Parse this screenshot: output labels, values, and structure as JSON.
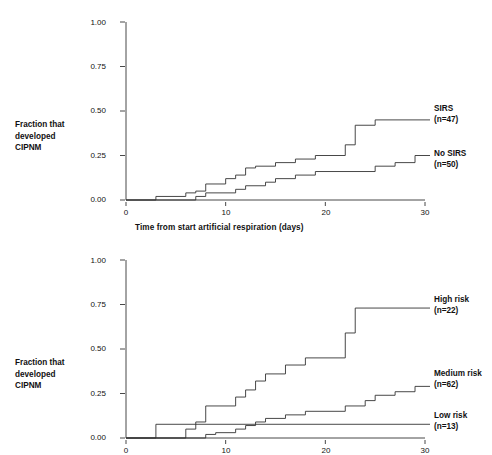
{
  "figure": {
    "background": "#ffffff",
    "line_color": "#333333",
    "text_color": "#111111"
  },
  "chart_data": [
    {
      "type": "line",
      "subtype": "step",
      "panel": "top",
      "title": "",
      "xlabel": "Time from start artificial respiration (days)",
      "ylabel": "Fraction that developed CIPNM",
      "ylabel_lines": [
        "Fraction that",
        "developed",
        "CIPNM"
      ],
      "xlim": [
        0,
        30
      ],
      "ylim": [
        0,
        1.0
      ],
      "xticks": [
        0,
        10,
        20,
        30
      ],
      "xticklabels": [
        "0",
        "10",
        "20",
        "30"
      ],
      "yticks": [
        0.0,
        0.25,
        0.5,
        0.75,
        1.0
      ],
      "yticklabels": [
        "0.00",
        "0.25",
        "0.50",
        "0.75",
        "1.00"
      ],
      "grid": false,
      "legend_position": "right-inline",
      "series": [
        {
          "name": "SIRS",
          "legend_lines": [
            "SIRS",
            "(n=47)"
          ],
          "n": 47,
          "points": [
            [
              0,
              0.0
            ],
            [
              3,
              0.0
            ],
            [
              3,
              0.02
            ],
            [
              6,
              0.02
            ],
            [
              6,
              0.04
            ],
            [
              7,
              0.04
            ],
            [
              7,
              0.05
            ],
            [
              8,
              0.05
            ],
            [
              8,
              0.09
            ],
            [
              10,
              0.09
            ],
            [
              10,
              0.12
            ],
            [
              11,
              0.12
            ],
            [
              11,
              0.14
            ],
            [
              12,
              0.14
            ],
            [
              12,
              0.18
            ],
            [
              13,
              0.18
            ],
            [
              13,
              0.19
            ],
            [
              15,
              0.19
            ],
            [
              15,
              0.21
            ],
            [
              17,
              0.21
            ],
            [
              17,
              0.23
            ],
            [
              19,
              0.23
            ],
            [
              19,
              0.25
            ],
            [
              22,
              0.25
            ],
            [
              22,
              0.31
            ],
            [
              23,
              0.31
            ],
            [
              23,
              0.42
            ],
            [
              25,
              0.42
            ],
            [
              25,
              0.45
            ],
            [
              30,
              0.45
            ]
          ]
        },
        {
          "name": "No SIRS",
          "legend_lines": [
            "No SIRS",
            "(n=50)"
          ],
          "n": 50,
          "points": [
            [
              0,
              0.0
            ],
            [
              7,
              0.0
            ],
            [
              7,
              0.02
            ],
            [
              8,
              0.02
            ],
            [
              8,
              0.04
            ],
            [
              11,
              0.04
            ],
            [
              11,
              0.06
            ],
            [
              12,
              0.06
            ],
            [
              12,
              0.08
            ],
            [
              14,
              0.08
            ],
            [
              14,
              0.1
            ],
            [
              15,
              0.1
            ],
            [
              15,
              0.12
            ],
            [
              17,
              0.12
            ],
            [
              17,
              0.14
            ],
            [
              19,
              0.14
            ],
            [
              19,
              0.16
            ],
            [
              25,
              0.16
            ],
            [
              25,
              0.19
            ],
            [
              27,
              0.19
            ],
            [
              27,
              0.21
            ],
            [
              29,
              0.21
            ],
            [
              29,
              0.25
            ],
            [
              30,
              0.25
            ]
          ]
        }
      ]
    },
    {
      "type": "line",
      "subtype": "step",
      "panel": "bottom",
      "title": "",
      "xlabel": "",
      "ylabel": "Fraction that developed CIPNM",
      "ylabel_lines": [
        "Fraction that",
        "developed",
        "CIPNM"
      ],
      "xlim": [
        0,
        30
      ],
      "ylim": [
        0,
        1.0
      ],
      "xticks": [
        0,
        10,
        20,
        30
      ],
      "xticklabels": [
        "0",
        "10",
        "20",
        "30"
      ],
      "yticks": [
        0.0,
        0.25,
        0.5,
        0.75,
        1.0
      ],
      "yticklabels": [
        "0.00",
        "0.25",
        "0.50",
        "0.75",
        "1.00"
      ],
      "grid": false,
      "legend_position": "right-inline",
      "series": [
        {
          "name": "High risk",
          "legend_lines": [
            "High risk",
            "(n=22)"
          ],
          "n": 22,
          "points": [
            [
              0,
              0.0
            ],
            [
              6,
              0.0
            ],
            [
              6,
              0.05
            ],
            [
              7,
              0.05
            ],
            [
              7,
              0.09
            ],
            [
              8,
              0.09
            ],
            [
              8,
              0.18
            ],
            [
              11,
              0.18
            ],
            [
              11,
              0.23
            ],
            [
              12,
              0.23
            ],
            [
              12,
              0.27
            ],
            [
              13,
              0.27
            ],
            [
              13,
              0.32
            ],
            [
              14,
              0.32
            ],
            [
              14,
              0.36
            ],
            [
              16,
              0.36
            ],
            [
              16,
              0.41
            ],
            [
              18,
              0.41
            ],
            [
              18,
              0.45
            ],
            [
              22,
              0.45
            ],
            [
              22,
              0.59
            ],
            [
              23,
              0.59
            ],
            [
              23,
              0.73
            ],
            [
              30,
              0.73
            ]
          ]
        },
        {
          "name": "Medium risk",
          "legend_lines": [
            "Medium risk",
            "(n=62)"
          ],
          "n": 62,
          "points": [
            [
              0,
              0.0
            ],
            [
              8,
              0.0
            ],
            [
              8,
              0.02
            ],
            [
              9,
              0.02
            ],
            [
              9,
              0.03
            ],
            [
              11,
              0.03
            ],
            [
              11,
              0.05
            ],
            [
              12,
              0.05
            ],
            [
              12,
              0.07
            ],
            [
              13,
              0.07
            ],
            [
              13,
              0.09
            ],
            [
              14,
              0.09
            ],
            [
              14,
              0.11
            ],
            [
              16,
              0.11
            ],
            [
              16,
              0.13
            ],
            [
              18,
              0.13
            ],
            [
              18,
              0.15
            ],
            [
              22,
              0.15
            ],
            [
              22,
              0.18
            ],
            [
              24,
              0.18
            ],
            [
              24,
              0.21
            ],
            [
              25,
              0.21
            ],
            [
              25,
              0.24
            ],
            [
              27,
              0.24
            ],
            [
              27,
              0.26
            ],
            [
              29,
              0.26
            ],
            [
              29,
              0.29
            ],
            [
              30,
              0.29
            ]
          ]
        },
        {
          "name": "Low risk",
          "legend_lines": [
            "Low risk",
            "(n=13)"
          ],
          "n": 13,
          "points": [
            [
              0,
              0.0
            ],
            [
              3,
              0.0
            ],
            [
              3,
              0.077
            ],
            [
              30,
              0.077
            ]
          ]
        }
      ]
    }
  ]
}
